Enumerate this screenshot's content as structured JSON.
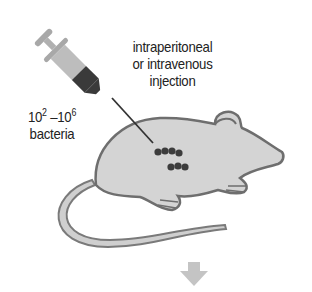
{
  "diagram": {
    "route_label": {
      "line1": "intraperitoneal",
      "line2": "or intravenous",
      "line3": "injection"
    },
    "dose_label": {
      "base1": "10",
      "exp1": "2",
      "dash": " –",
      "base2": "10",
      "exp2": "6",
      "unit": "bacteria"
    },
    "icons": [
      "syringe-icon",
      "mouse-icon",
      "bacteria-dots-icon",
      "down-arrow-icon"
    ],
    "colors": {
      "mouse_fill": "#d4d4d4",
      "mouse_outline": "#6e6e6e",
      "syringe_barrel": "#bdbdbd",
      "syringe_liquid": "#3a3a3a",
      "bacteria": "#3c3c3c",
      "arrow": "#c4c4c4"
    }
  }
}
